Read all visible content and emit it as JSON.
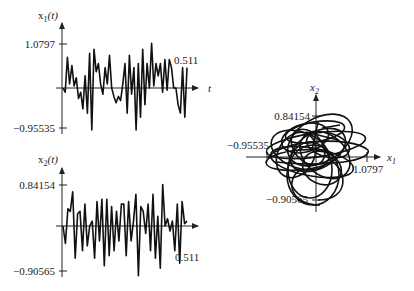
{
  "chart_data": [
    {
      "type": "line",
      "title": "",
      "ylabel": "x1(t)",
      "ylabel_main": "x",
      "ylabel_sub": "1",
      "ylabel_arg": "(t)",
      "xlabel": "t",
      "ytick_top": "1.0797",
      "ytick_bottom": "−0.95535",
      "x_end_label": "0.511",
      "ylim": [
        -0.95535,
        1.0797
      ],
      "xlim": [
        0,
        0.511
      ],
      "values": [
        0.0,
        -0.1,
        0.75,
        0.1,
        0.55,
        0.05,
        0.25,
        -0.25,
        -0.1,
        -0.5,
        0.3,
        -0.6,
        0.85,
        -1.0,
        0.95,
        0.4,
        0.6,
        0.1,
        -0.15,
        0.5,
        0.1,
        0.8,
        0.0,
        -0.2,
        -0.35,
        -0.2,
        -0.3,
        0.1,
        0.6,
        -0.6,
        0.8,
        -0.15,
        0.5,
        -1.0,
        0.6,
        -0.7,
        0.95,
        -0.4,
        0.6,
        0.0,
        1.1,
        0.05,
        0.6,
        0.3,
        0.6,
        -0.1,
        0.7,
        -0.05,
        0.7,
        0.5,
        0.0,
        0.0,
        -0.4,
        -0.6,
        0.5,
        -0.7,
        0.5
      ]
    },
    {
      "type": "line",
      "title": "",
      "ylabel": "x2(t)",
      "ylabel_main": "x",
      "ylabel_sub": "2",
      "ylabel_arg": "(t)",
      "xlabel": "t",
      "ytick_top": "0.84154",
      "ytick_bottom": "−0.90565",
      "x_end_label": "0.511",
      "ylim": [
        -0.90565,
        0.84154
      ],
      "xlim": [
        0,
        0.511
      ],
      "values": [
        0.0,
        -0.35,
        0.35,
        0.3,
        0.7,
        -0.65,
        0.25,
        0.3,
        -0.5,
        0.45,
        -0.4,
        0.0,
        0.1,
        -0.65,
        0.5,
        -0.3,
        0.55,
        -0.8,
        0.55,
        -0.6,
        0.4,
        -0.5,
        0.3,
        -0.3,
        0.45,
        0.45,
        -0.6,
        0.5,
        -0.3,
        0.1,
        0.65,
        -1.0,
        0.4,
        0.3,
        -0.15,
        0.45,
        -0.5,
        0.65,
        -0.65,
        0.2,
        -0.85,
        0.85,
        0.0,
        0.15,
        -0.1,
        0.1,
        -0.5,
        0.45,
        -0.75,
        0.5,
        0.05,
        0.1
      ]
    },
    {
      "type": "line",
      "title": "",
      "xlabel": "x1",
      "ylabel": "x2",
      "xlabel_main": "x",
      "xlabel_sub": "1",
      "ylabel_main": "x",
      "ylabel_sub": "2",
      "xtick_left": "−0.95535",
      "xtick_right": "1.0797",
      "ytick_top": "0.84154",
      "ytick_bottom": "−0.90565",
      "xlim": [
        -0.95535,
        1.0797
      ],
      "ylim": [
        -0.90565,
        0.84154
      ],
      "description": "phase portrait x2 vs x1, tangled trajectory"
    }
  ]
}
